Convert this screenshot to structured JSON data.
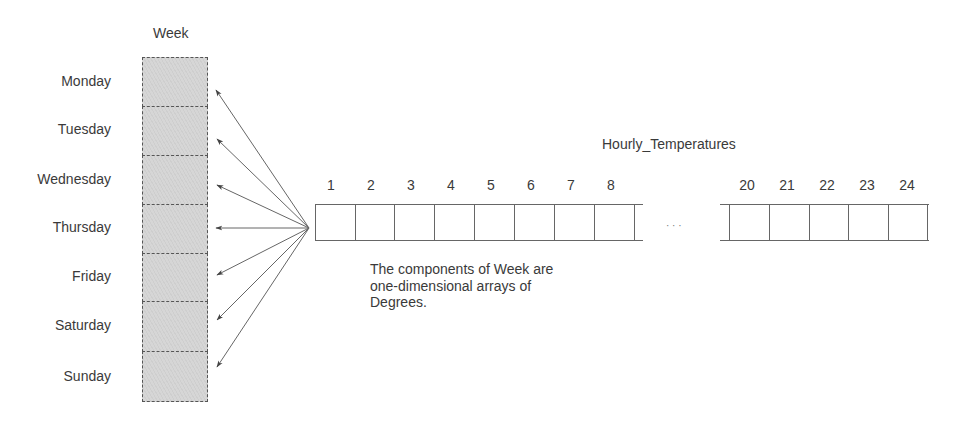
{
  "diagram": {
    "array_title": "Week",
    "days": [
      "Monday",
      "Tuesday",
      "Wednesday",
      "Thursday",
      "Friday",
      "Saturday",
      "Sunday"
    ],
    "component_title": "Hourly_Temperatures",
    "left_indices": [
      "1",
      "2",
      "3",
      "4",
      "5",
      "6",
      "7",
      "8"
    ],
    "right_indices": [
      "20",
      "21",
      "22",
      "23",
      "24"
    ],
    "ellipsis": "· · ·",
    "caption_lines": [
      "The components of Week are",
      "one-dimensional arrays of",
      "Degrees."
    ]
  }
}
